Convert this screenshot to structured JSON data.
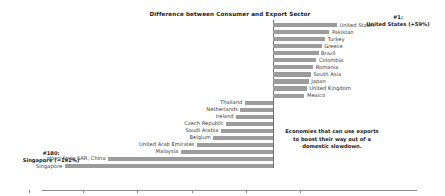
{
  "chart_data": {
    "type": "bar",
    "orientation": "horizontal",
    "title": "Difference between Consumer and Export Sector",
    "xlabel": "",
    "ylabel": "",
    "xlim": [
      -240,
      40
    ],
    "xticks": [
      -225,
      -175,
      -125,
      -75,
      -25,
      25
    ],
    "xtick_labels": [
      "−225",
      "−175",
      "−125",
      "−75",
      "−25",
      "25"
    ],
    "grid": false,
    "legend": "none",
    "bar_color": "#9c9c9c",
    "categories": [
      "United States",
      "Pakistan",
      "Turkey",
      "Greece",
      "Brazil",
      "Colombia",
      "Romania",
      "South Asia",
      "Japan",
      "United Kingdom",
      "Mexico",
      "Thailand",
      "Netherlands",
      "Ireland",
      "Czech Republic",
      "Saudi Arabia",
      "Belgium",
      "United Arab Emirates",
      "Malaysia",
      "Hong Kong SAR, China",
      "Singapore"
    ],
    "values": [
      59,
      52,
      48,
      45,
      42,
      40,
      37,
      35,
      33,
      31,
      29,
      -26,
      -30,
      -34,
      -43,
      -48,
      -55,
      -70,
      -85,
      -152,
      -192
    ],
    "annotations": [
      {
        "name": "top-rank-annotation",
        "line1": "#1:",
        "line2": "United States (+59%)"
      },
      {
        "name": "bottom-rank-annotation",
        "line1": "#180:",
        "line2": "Singapore (−192%)"
      },
      {
        "name": "center-note",
        "line1": "Economies that can use exports",
        "line2": "to boost their way out of a",
        "line3": "domestic slowdown."
      }
    ]
  }
}
